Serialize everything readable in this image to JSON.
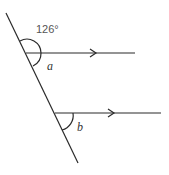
{
  "diagram": {
    "type": "parallel-lines-transversal",
    "given_angle": "126°",
    "angle_labels": [
      "a",
      "b"
    ],
    "colors": {
      "line": "#2a2a2a",
      "background": "#ffffff"
    }
  }
}
